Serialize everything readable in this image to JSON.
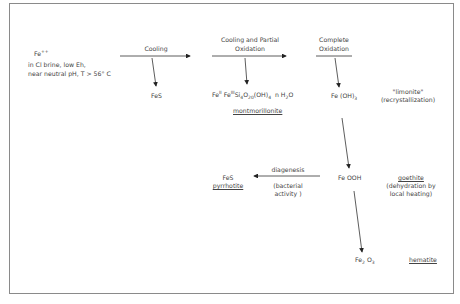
{
  "diagram": {
    "start": {
      "ion": "Fe",
      "ion_charge": "++",
      "line1": "in Cl brine, low Eh,",
      "line2": "near neutral pH, T > 56° C"
    },
    "steps": [
      {
        "label": "Cooling"
      },
      {
        "label_line1": "Cooling and Partial",
        "label_line2": "Oxidation"
      },
      {
        "label_line1": "Complete",
        "label_line2": "Oxidation"
      }
    ],
    "products": {
      "fes_cooling": "FeS",
      "montmorillonite_formula": {
        "fe1": "Fe",
        "fe1_sup": "II",
        "fe2": "Fe",
        "fe2_sup": "III",
        "si": "Si",
        "si_sub": "4",
        "o": "O",
        "o_sub": "20",
        "oh": "(OH)",
        "oh_sub": "4",
        "water": "n H",
        "water_sub": "2",
        "water_o": "O"
      },
      "montmorillonite_name": "montmorillonite",
      "feoh3": "Fe (OH)",
      "feoh3_sub": "3",
      "limonite_name": "\"limonite\"",
      "limonite_note": "(recrystallization)",
      "feooh": "Fe OOH",
      "goethite_name": "goethite",
      "goethite_note1": "(dehydration by",
      "goethite_note2": "local heating)",
      "diagenesis_label": "diagenesis",
      "diagenesis_note1": "(bacterial",
      "diagenesis_note2": "activity )",
      "pyrrhotite_formula": "FeS",
      "pyrrhotite_name": "pyrrhotite",
      "fe2o3": "Fe",
      "fe2o3_sub1": "2",
      "fe2o3_o": "O",
      "fe2o3_sub2": "3",
      "hematite_name": "hematite"
    }
  }
}
